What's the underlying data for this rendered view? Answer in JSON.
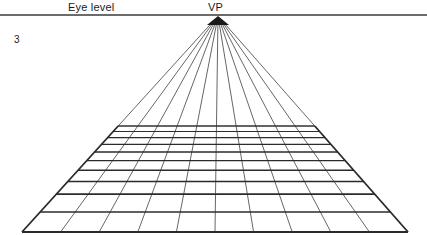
{
  "figure": {
    "number": "3",
    "eye_level_label": "Eye level",
    "vp_label": "VP"
  },
  "colors": {
    "background": "#ffffff",
    "ink": "#1a1a1a",
    "horizon": "#3a3a3a",
    "grid_line": "#2b2b2b",
    "ray_line": "#333333"
  },
  "geometry": {
    "canvas": {
      "width": 427,
      "height": 235
    },
    "horizon": {
      "y": 15,
      "x_start": 0,
      "x_end": 427,
      "thickness": 1.6
    },
    "vanishing_point": {
      "x": 218,
      "y": 16
    },
    "vp_marker": {
      "half_width": 11,
      "height": 9
    },
    "grid": {
      "columns": 10,
      "rows": 10,
      "top_y": 126,
      "bottom_y": 232,
      "bottom_left_x": 22,
      "bottom_right_x": 408,
      "top_left_x": 105,
      "top_right_x": 328,
      "ray_top_y": 24,
      "depth_exponent": 2.05
    },
    "bottom_divisions_x": [
      22,
      60.6,
      99.2,
      137.8,
      176.4,
      215,
      253.6,
      292.2,
      330.8,
      369.4,
      408
    ],
    "horizontal_line_y": [
      126,
      131.5,
      137.6,
      144.4,
      152.0,
      160.6,
      170.3,
      181.4,
      194.1,
      212.0,
      232
    ],
    "notes": {
      "type": "one-point perspective grid",
      "ray_count": 11,
      "horizontal_count": 11
    }
  }
}
